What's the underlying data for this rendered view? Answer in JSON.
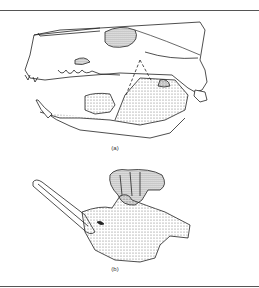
{
  "figure": {
    "panels": [
      {
        "id": "a",
        "label": "(a)",
        "subject": "skull lateral view with lower jaw"
      },
      {
        "id": "b",
        "label": "(b)",
        "subject": "isolated lower jaw (mandible)"
      }
    ],
    "colors": {
      "line": "#222222",
      "stipple": "#555555",
      "rule": "#555555"
    }
  }
}
